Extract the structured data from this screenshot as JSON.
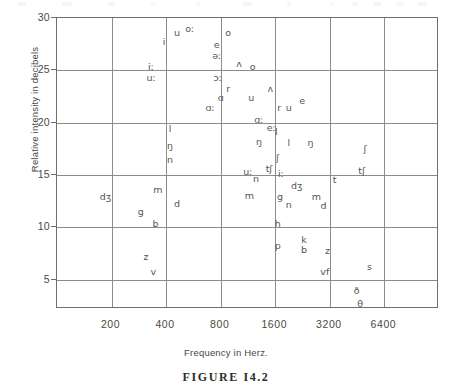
{
  "figure": {
    "caption": "FIGURE I4.2",
    "xlabel": "Frequency in Herz.",
    "ylabel": "Relative intensity in decibels"
  },
  "chart_data": {
    "type": "scatter",
    "title": "",
    "xlabel": "Frequency in Herz.",
    "ylabel": "Relative intensity in decibels",
    "xscale": "log2",
    "xlim": [
      100,
      12800
    ],
    "ylim": [
      2.2,
      30
    ],
    "grid": true,
    "legend": "none",
    "xticks": [
      "200",
      "400",
      "800",
      "1600",
      "3200",
      "6400"
    ],
    "xtick_values": [
      200,
      400,
      800,
      1600,
      3200,
      6400
    ],
    "yticks": [
      "30",
      "25",
      "20",
      "15",
      "10",
      "5"
    ],
    "ytick_values": [
      30,
      25,
      20,
      15,
      10,
      5
    ],
    "point_label": "phonetic symbol",
    "points": [
      {
        "label": "u",
        "freq": 460,
        "db": 28.6
      },
      {
        "label": "oː",
        "freq": 540,
        "db": 29.0
      },
      {
        "label": "o",
        "freq": 880,
        "db": 28.6
      },
      {
        "label": "i",
        "freq": 390,
        "db": 27.7
      },
      {
        "label": "e",
        "freq": 760,
        "db": 27.4
      },
      {
        "label": "əː",
        "freq": 760,
        "db": 26.4
      },
      {
        "label": "ʌ",
        "freq": 1010,
        "db": 25.6
      },
      {
        "label": "o",
        "freq": 1200,
        "db": 25.3
      },
      {
        "label": "iː",
        "freq": 330,
        "db": 25.3
      },
      {
        "label": "uː",
        "freq": 330,
        "db": 24.3
      },
      {
        "label": "ɔː",
        "freq": 770,
        "db": 24.3
      },
      {
        "label": "r",
        "freq": 880,
        "db": 23.2
      },
      {
        "label": "ʌ",
        "freq": 1500,
        "db": 23.2
      },
      {
        "label": "ɑ",
        "freq": 800,
        "db": 22.4
      },
      {
        "label": "u",
        "freq": 1180,
        "db": 22.4
      },
      {
        "label": "e",
        "freq": 2250,
        "db": 22.1
      },
      {
        "label": "ɑː",
        "freq": 700,
        "db": 21.4
      },
      {
        "label": "r",
        "freq": 1680,
        "db": 21.4
      },
      {
        "label": "u",
        "freq": 1900,
        "db": 21.4
      },
      {
        "label": "ɑː",
        "freq": 1300,
        "db": 20.3
      },
      {
        "label": "eː",
        "freq": 1520,
        "db": 19.5
      },
      {
        "label": "l",
        "freq": 420,
        "db": 19.4
      },
      {
        "label": "l",
        "freq": 1620,
        "db": 19.1
      },
      {
        "label": "ŋ",
        "freq": 420,
        "db": 17.8
      },
      {
        "label": "ŋ",
        "freq": 1300,
        "db": 18.2
      },
      {
        "label": "l",
        "freq": 1900,
        "db": 18.1
      },
      {
        "label": "ŋ",
        "freq": 2500,
        "db": 18.1
      },
      {
        "label": "ʃ",
        "freq": 5000,
        "db": 17.5
      },
      {
        "label": "n",
        "freq": 420,
        "db": 16.4
      },
      {
        "label": "ʃ",
        "freq": 1650,
        "db": 16.6
      },
      {
        "label": "tʃ",
        "freq": 1480,
        "db": 15.6
      },
      {
        "label": "tʃ",
        "freq": 4800,
        "db": 15.4
      },
      {
        "label": "uː",
        "freq": 1130,
        "db": 15.3
      },
      {
        "label": "iː",
        "freq": 1720,
        "db": 15.1
      },
      {
        "label": "n",
        "freq": 1250,
        "db": 14.6
      },
      {
        "label": "t",
        "freq": 3400,
        "db": 14.5
      },
      {
        "label": "dʒ",
        "freq": 2100,
        "db": 14.0
      },
      {
        "label": "m",
        "freq": 360,
        "db": 13.6
      },
      {
        "label": "dʒ",
        "freq": 185,
        "db": 12.9
      },
      {
        "label": "m",
        "freq": 1150,
        "db": 13.0
      },
      {
        "label": "g",
        "freq": 1700,
        "db": 12.9
      },
      {
        "label": "m",
        "freq": 2700,
        "db": 12.9
      },
      {
        "label": "d",
        "freq": 460,
        "db": 12.2
      },
      {
        "label": "n",
        "freq": 1900,
        "db": 12.1
      },
      {
        "label": "d",
        "freq": 2950,
        "db": 12.0
      },
      {
        "label": "g",
        "freq": 290,
        "db": 11.5
      },
      {
        "label": "b",
        "freq": 350,
        "db": 10.3
      },
      {
        "label": "h",
        "freq": 1650,
        "db": 10.3
      },
      {
        "label": "p",
        "freq": 1650,
        "db": 8.2
      },
      {
        "label": "k",
        "freq": 2300,
        "db": 8.8
      },
      {
        "label": "b",
        "freq": 2300,
        "db": 7.8
      },
      {
        "label": "z",
        "freq": 3100,
        "db": 7.7
      },
      {
        "label": "z",
        "freq": 310,
        "db": 7.2
      },
      {
        "label": "s",
        "freq": 5300,
        "db": 6.2
      },
      {
        "label": "vf",
        "freq": 3000,
        "db": 5.7
      },
      {
        "label": "v",
        "freq": 340,
        "db": 5.7
      },
      {
        "label": "ð",
        "freq": 4500,
        "db": 3.9
      },
      {
        "label": "θ",
        "freq": 4700,
        "db": 2.7
      }
    ]
  }
}
